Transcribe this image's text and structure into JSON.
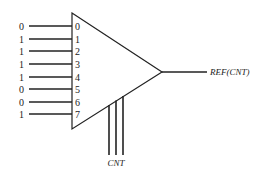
{
  "diagram": {
    "title": "",
    "component": "multiplexer",
    "inputs": [
      {
        "index": "0",
        "value": "0",
        "y": 26
      },
      {
        "index": "1",
        "value": "1",
        "y": 39
      },
      {
        "index": "2",
        "value": "1",
        "y": 51
      },
      {
        "index": "3",
        "value": "1",
        "y": 64
      },
      {
        "index": "4",
        "value": "1",
        "y": 77
      },
      {
        "index": "5",
        "value": "0",
        "y": 89
      },
      {
        "index": "6",
        "value": "0",
        "y": 102
      },
      {
        "index": "7",
        "value": "1",
        "y": 114
      }
    ],
    "output_label": "REF(CNT)",
    "select_label": "CNT",
    "select_line_count": 3,
    "colors": {
      "line": "#222222",
      "background": "#ffffff"
    }
  }
}
